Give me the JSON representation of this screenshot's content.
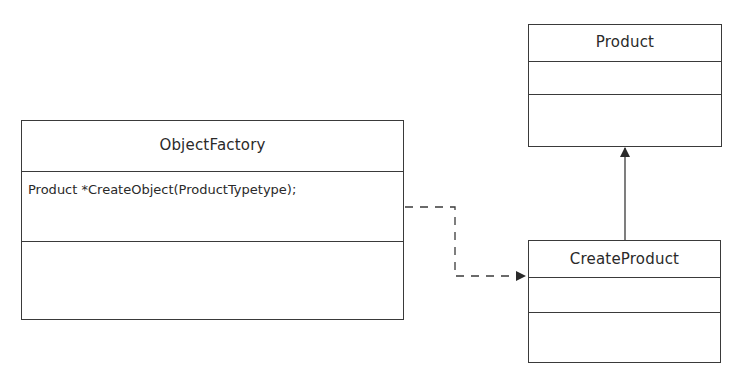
{
  "diagram": {
    "type": "uml-class-diagram",
    "classes": [
      {
        "id": "object-factory",
        "name": "ObjectFactory",
        "attributes": [],
        "methods": [
          "Product *CreateObject(ProductTypetype);"
        ]
      },
      {
        "id": "product",
        "name": "Product",
        "attributes": [],
        "methods": []
      },
      {
        "id": "create-product",
        "name": "CreateProduct",
        "attributes": [],
        "methods": []
      }
    ],
    "relationships": [
      {
        "from": "ObjectFactory",
        "to": "CreateProduct",
        "kind": "dependency",
        "style": "dashed-arrow"
      },
      {
        "from": "CreateProduct",
        "to": "Product",
        "kind": "association",
        "style": "solid-arrow"
      }
    ],
    "colors": {
      "line": "#3a3a3a",
      "text": "#2a2a2a",
      "background": "#ffffff"
    }
  }
}
